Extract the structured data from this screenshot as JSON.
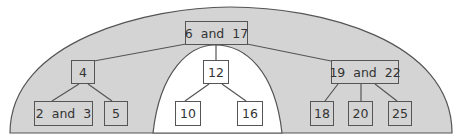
{
  "diagram": {
    "type": "2-3 tree",
    "colors": {
      "shaded_region": "#d4d4d4",
      "outline": "#555555",
      "background": "#ffffff"
    },
    "nodes": {
      "root": {
        "label": "6  and  17"
      },
      "n4": {
        "label": "4"
      },
      "n12": {
        "label": "12"
      },
      "n19_22": {
        "label": "19  and  22"
      },
      "n2_3": {
        "label": "2  and  3"
      },
      "n5": {
        "label": "5"
      },
      "n10": {
        "label": "10"
      },
      "n16": {
        "label": "16"
      },
      "n18": {
        "label": "18"
      },
      "n20": {
        "label": "20"
      },
      "n25": {
        "label": "25"
      }
    },
    "edges": [
      [
        "root",
        "n4"
      ],
      [
        "root",
        "n12"
      ],
      [
        "root",
        "n19_22"
      ],
      [
        "n4",
        "n2_3"
      ],
      [
        "n4",
        "n5"
      ],
      [
        "n12",
        "n10"
      ],
      [
        "n12",
        "n16"
      ],
      [
        "n19_22",
        "n18"
      ],
      [
        "n19_22",
        "n20"
      ],
      [
        "n19_22",
        "n25"
      ]
    ]
  }
}
